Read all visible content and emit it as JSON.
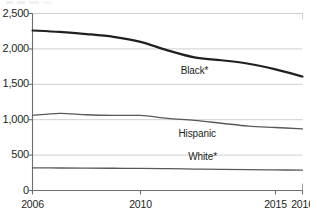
{
  "chart_data": {
    "type": "line",
    "title": "",
    "subtitle": "",
    "xlabel": "",
    "ylabel": "",
    "xlim": [
      2006,
      2016
    ],
    "ylim": [
      0,
      2500
    ],
    "grid": true,
    "grid_axis": "y",
    "legend": "inline-labels",
    "x": [
      2006,
      2007,
      2008,
      2009,
      2010,
      2011,
      2012,
      2013,
      2014,
      2015,
      2016
    ],
    "y_ticks": [
      0,
      500,
      1000,
      1500,
      2000,
      2500
    ],
    "y_tick_labels": [
      "0",
      "500",
      "1,000",
      "1,500",
      "2,000",
      "2,500"
    ],
    "x_ticks": [
      2006,
      2010,
      2015,
      2016
    ],
    "x_tick_labels": [
      "2006",
      "2010",
      "2015",
      "2016"
    ],
    "series": [
      {
        "name": "Black*",
        "label": "Black*",
        "color": "#231f20",
        "line_width": 2.2,
        "values": [
          2260,
          2240,
          2210,
          2170,
          2100,
          1980,
          1880,
          1840,
          1790,
          1710,
          1610
        ]
      },
      {
        "name": "Hispanic",
        "label": "Hispanic",
        "color": "#58595b",
        "line_width": 1.3,
        "values": [
          1060,
          1090,
          1070,
          1060,
          1060,
          1020,
          990,
          950,
          910,
          890,
          870
        ]
      },
      {
        "name": "White*",
        "label": "White*",
        "color": "#58595b",
        "line_width": 1.3,
        "values": [
          320,
          318,
          316,
          314,
          312,
          308,
          303,
          298,
          294,
          291,
          288
        ]
      }
    ],
    "annotations": [
      {
        "name": "black-series-label",
        "text": "Black*",
        "x": 2012.0,
        "y": 1690
      },
      {
        "name": "hispanic-series-label",
        "text": "Hispanic",
        "x": 2012.1,
        "y": 800
      },
      {
        "name": "white-series-label",
        "text": "White*",
        "x": 2012.3,
        "y": 470
      }
    ]
  },
  "axis": {
    "y_labels": [
      "2,500",
      "2,000",
      "1,500",
      "1,000",
      "500",
      "0"
    ],
    "x_labels": [
      "2006",
      "2010",
      "2015",
      "2016"
    ]
  }
}
